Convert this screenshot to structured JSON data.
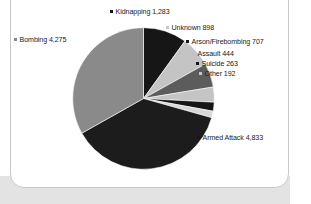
{
  "figure": {
    "source_credit": "U.S. National Counterterrorism Center (NCTC, 2011)."
  },
  "labels": {
    "kidnapping": "Kidnapping 1,283",
    "unknown": "Unknown 898",
    "arson": "Arson/Firebombing 707",
    "assault": "Assault 444",
    "suicide": "Suicide 263",
    "other": "Other 192",
    "bombing": "Bombing 4,275",
    "armed_attack": "Armed Attack 4,833"
  },
  "chart_data": {
    "type": "pie",
    "title": "",
    "subtitle": "",
    "xlabel": "",
    "ylabel": "",
    "legend_position": "callout-labels",
    "grid": false,
    "total": 12895,
    "start_angle_deg": 0,
    "direction": "clockwise",
    "categories": [
      "Kidnapping",
      "Unknown",
      "Arson/Firebombing",
      "Assault",
      "Suicide",
      "Other",
      "Armed Attack",
      "Bombing"
    ],
    "values": [
      1283,
      898,
      707,
      444,
      263,
      192,
      4833,
      4275
    ],
    "slices": [
      {
        "label": "Kidnapping",
        "value": 1283,
        "display": "1,283",
        "percent": 9.9,
        "color": "#161616"
      },
      {
        "label": "Unknown",
        "value": 898,
        "display": "898",
        "percent": 7.0,
        "color": "#c4c4c4"
      },
      {
        "label": "Arson/Firebombing",
        "value": 707,
        "display": "707",
        "percent": 5.5,
        "color": "#5c5c5c"
      },
      {
        "label": "Assault",
        "value": 444,
        "display": "444",
        "percent": 3.4,
        "color": "#c4c4c4"
      },
      {
        "label": "Suicide",
        "value": 263,
        "display": "263",
        "percent": 2.0,
        "color": "#161616"
      },
      {
        "label": "Other",
        "value": 192,
        "display": "192",
        "percent": 1.5,
        "color": "#d8d8d8"
      },
      {
        "label": "Armed Attack",
        "value": 4833,
        "display": "4,833",
        "percent": 37.5,
        "color": "#1c1c1c"
      },
      {
        "label": "Bombing",
        "value": 4275,
        "display": "4,275",
        "percent": 33.2,
        "color": "#8a8a8a"
      }
    ]
  },
  "colors": {
    "black": "#161616",
    "dark_gray": "#5c5c5c",
    "mid_gray": "#8a8a8a",
    "light_gray": "#c4c4c4",
    "card_background": "#ffffff",
    "band_background": "#e3e3e3"
  }
}
